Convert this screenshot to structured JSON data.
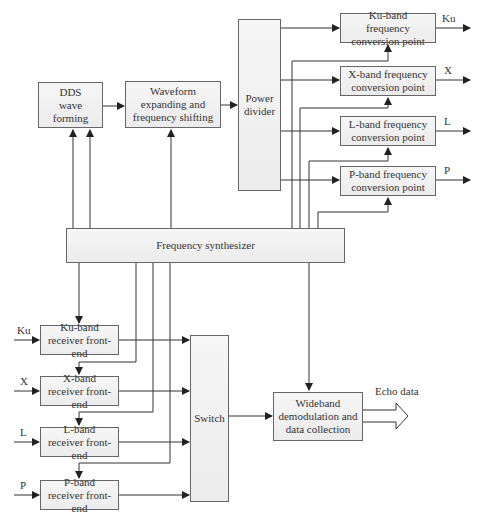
{
  "diagram": {
    "blocks": {
      "dds": "DDS wave forming",
      "waveform": "Waveform expanding and frequency shifting",
      "power_divider": "Power divider",
      "ku_conv": "Ku-band frequency conversion point",
      "x_conv": "X-band frequency conversion point",
      "l_conv": "L-band frequency conversion point",
      "p_conv": "P-band frequency conversion point",
      "synth": "Frequency synthesizer",
      "ku_rx": "Ku-band receiver front-end",
      "x_rx": "X-band receiver front-end",
      "l_rx": "L-band receiver front-end",
      "p_rx": "P-band receiver front-end",
      "switch": "Switch",
      "wideband": "Wideband demodulation and data collection"
    },
    "output_labels": {
      "ku": "Ku",
      "x": "X",
      "l": "L",
      "p": "P"
    },
    "input_labels": {
      "ku": "Ku",
      "x": "X",
      "l": "L",
      "p": "P"
    },
    "echo_label": "Echo data",
    "colors": {
      "line": "#333333",
      "box_border": "#666666",
      "box_fill": "#eeeeee"
    }
  }
}
